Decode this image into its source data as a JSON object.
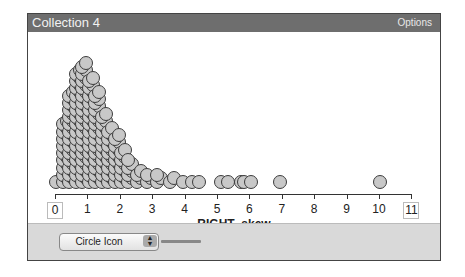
{
  "window": {
    "title": "Collection 4",
    "options_label": "Options"
  },
  "footer": {
    "select_value": "Circle Icon"
  },
  "colors": {
    "titlebar": "#6e6e6e",
    "dot_fill": "#c8c8c8",
    "dot_stroke": "#3c3c3c",
    "footer": "#d9d9d9"
  },
  "chart_data": {
    "type": "scatter",
    "subtype": "dot plot (stacked)",
    "title": "",
    "xlabel": "RIGHT_skew",
    "ylabel": "",
    "xlim": [
      0,
      11
    ],
    "x_ticks": [
      0,
      1,
      2,
      3,
      4,
      5,
      6,
      7,
      8,
      9,
      10,
      11
    ],
    "grid": false,
    "bins": [
      {
        "x": 0.1,
        "stack_height": 1
      },
      {
        "x": 0.3,
        "stack_height": 18
      },
      {
        "x": 0.5,
        "stack_height": 26
      },
      {
        "x": 0.7,
        "stack_height": 32
      },
      {
        "x": 0.9,
        "stack_height": 34
      },
      {
        "x": 1.1,
        "stack_height": 30
      },
      {
        "x": 1.3,
        "stack_height": 26
      },
      {
        "x": 1.5,
        "stack_height": 20
      },
      {
        "x": 1.7,
        "stack_height": 16
      },
      {
        "x": 1.9,
        "stack_height": 14
      },
      {
        "x": 2.1,
        "stack_height": 10
      },
      {
        "x": 2.3,
        "stack_height": 7
      },
      {
        "x": 2.6,
        "stack_height": 4
      },
      {
        "x": 2.9,
        "stack_height": 3
      },
      {
        "x": 3.2,
        "stack_height": 3
      },
      {
        "x": 3.6,
        "stack_height": 2
      },
      {
        "x": 4.0,
        "stack_height": 1
      },
      {
        "x": 4.3,
        "stack_height": 1
      },
      {
        "x": 4.5,
        "stack_height": 1
      },
      {
        "x": 5.2,
        "stack_height": 1
      },
      {
        "x": 5.4,
        "stack_height": 1
      },
      {
        "x": 5.8,
        "stack_height": 1
      },
      {
        "x": 5.9,
        "stack_height": 1
      },
      {
        "x": 6.1,
        "stack_height": 1
      },
      {
        "x": 7.0,
        "stack_height": 1
      },
      {
        "x": 10.1,
        "stack_height": 1
      }
    ]
  }
}
